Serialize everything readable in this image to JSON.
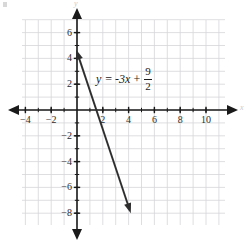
{
  "figure": {
    "background_color": "#ffffff",
    "width": 246,
    "height": 244
  },
  "chart_data": {
    "type": "line",
    "title": "",
    "xlabel": "x",
    "ylabel": "y",
    "xlim": [
      -4.3,
      10.8
    ],
    "ylim": [
      -8.8,
      6.8
    ],
    "grid": true,
    "grid_color": "#d6d6d9",
    "grid_step": 1,
    "legend": "none",
    "axis_color": "#1a1a1a",
    "line_color": "#2e2e2e",
    "equation": "y = -3x + 9/2",
    "slope": -3,
    "intercept": 4.5,
    "x_intercept": 1.5,
    "series": [
      {
        "name": "y = -3x + 9/2",
        "arrows": "both",
        "points": [
          {
            "x": -0.06,
            "y": 4.68
          },
          {
            "x": 4.17,
            "y": -8.0
          }
        ]
      }
    ],
    "xticks": [
      {
        "value": -4,
        "label": "-4"
      },
      {
        "value": -2,
        "label": "-2"
      },
      {
        "value": 2,
        "label": "2"
      },
      {
        "value": 4,
        "label": "4"
      },
      {
        "value": 6,
        "label": "6"
      },
      {
        "value": 8,
        "label": "8"
      },
      {
        "value": 10,
        "label": "10"
      }
    ],
    "yticks": [
      {
        "value": 6,
        "label": "6"
      },
      {
        "value": 4,
        "label": "4"
      },
      {
        "value": 2,
        "label": "2"
      },
      {
        "value": -2,
        "label": "-2"
      },
      {
        "value": -4,
        "label": "-4"
      },
      {
        "value": -6,
        "label": "-6"
      },
      {
        "value": -8,
        "label": "-8"
      }
    ],
    "annotation": {
      "lhs": "y",
      "equals": "=",
      "term": "-3x",
      "plus": "+",
      "fraction_numerator": "9",
      "fraction_denominator": "2"
    }
  }
}
